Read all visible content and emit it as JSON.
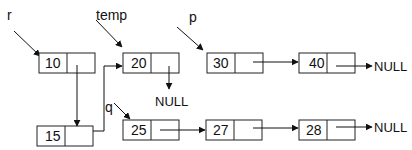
{
  "diagram": {
    "title": "",
    "type": "linked-list",
    "colors": {
      "stroke": "#111111",
      "background": "#ffffff"
    },
    "pointers": [
      {
        "id": "r",
        "label": "r",
        "target": "n10"
      },
      {
        "id": "temp",
        "label": "temp",
        "target": "n20"
      },
      {
        "id": "p",
        "label": "p",
        "target": "n30"
      },
      {
        "id": "q",
        "label": "q",
        "target": "n25"
      }
    ],
    "nodes": [
      {
        "id": "n10",
        "value": "10",
        "next": "n15"
      },
      {
        "id": "n15",
        "value": "15",
        "next": "n20"
      },
      {
        "id": "n20",
        "value": "20",
        "next": "NULL"
      },
      {
        "id": "n30",
        "value": "30",
        "next": "n40"
      },
      {
        "id": "n40",
        "value": "40",
        "next": "NULL"
      },
      {
        "id": "n25",
        "value": "25",
        "next": "n27"
      },
      {
        "id": "n27",
        "value": "27",
        "next": "n28"
      },
      {
        "id": "n28",
        "value": "28",
        "next": "NULL"
      }
    ],
    "null_label": "NULL",
    "labels": {
      "r": "r",
      "temp": "temp",
      "p": "p",
      "q": "q",
      "null_20": "NULL",
      "null_40": "NULL",
      "null_28": "NULL"
    },
    "values": {
      "n10": "10",
      "n15": "15",
      "n20": "20",
      "n25": "25",
      "n30": "30",
      "n40": "40",
      "n27": "27",
      "n28": "28"
    }
  }
}
